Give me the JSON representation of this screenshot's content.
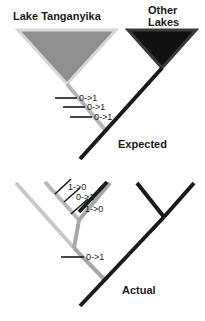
{
  "figure": {
    "width": 205,
    "height": 321,
    "background": "#ffffff",
    "colors": {
      "black": "#1a1a1a",
      "gray": "#9a9a9a",
      "light_gray": "#c9c9c9",
      "fill_gray": "#8f8f8f",
      "fill_black": "#111111",
      "outline_light": "#d0d0d0",
      "text": "#1a1a1a"
    }
  },
  "panels": [
    {
      "id": "expected",
      "label": "Expected",
      "label_pos": {
        "x": 118,
        "y": 146
      },
      "clades": [
        {
          "name": "lake-tanganyika",
          "label": "Lake Tanganyika",
          "label_lines": [
            "Lake Tanganyika"
          ],
          "label_pos": {
            "x": 13,
            "y": 16
          },
          "fill": "#8f8f8f",
          "outline": "#d0d0d0",
          "triangle": "18,30 116,30 67,84"
        },
        {
          "name": "other-lakes",
          "label": "Other Lakes",
          "label_lines": [
            "Other",
            "Lakes"
          ],
          "label_pos": {
            "x": 148,
            "y": 12
          },
          "fill": "#111111",
          "outline": "#2b2b2b",
          "triangle": "128,30 196,30 162,68"
        }
      ],
      "branches": [
        {
          "name": "tanganyika-stem",
          "color": "#b5b5b5",
          "width": 4,
          "x1": 67,
          "y1": 84,
          "x2": 106,
          "y2": 131
        },
        {
          "name": "other-lakes-stem",
          "color": "#1a1a1a",
          "width": 4,
          "x1": 162,
          "y1": 68,
          "x2": 106,
          "y2": 131
        },
        {
          "name": "root-stem",
          "color": "#1a1a1a",
          "width": 4,
          "x1": 106,
          "y1": 131,
          "x2": 80,
          "y2": 159
        }
      ],
      "changes": [
        {
          "name": "change-1",
          "text": "0->1",
          "tick": {
            "x1": 56,
            "y1": 98,
            "x2": 76,
            "y2": 98
          },
          "label_pos": {
            "x": 78,
            "y": 101
          }
        },
        {
          "name": "change-2",
          "text": "0->1",
          "tick": {
            "x1": 63,
            "y1": 107,
            "x2": 84,
            "y2": 107
          },
          "label_pos": {
            "x": 86,
            "y": 110
          }
        },
        {
          "name": "change-3",
          "text": "0->1",
          "tick": {
            "x1": 70,
            "y1": 117,
            "x2": 91,
            "y2": 117
          },
          "label_pos": {
            "x": 93,
            "y": 120
          }
        }
      ]
    },
    {
      "id": "actual",
      "label": "Actual",
      "label_pos": {
        "x": 122,
        "y": 292
      },
      "clades": [],
      "branches": [
        {
          "name": "tip-1-light",
          "color": "#c9c9c9",
          "width": 4,
          "x1": 16,
          "y1": 183,
          "x2": 73,
          "y2": 247
        },
        {
          "name": "tip-2-gray",
          "color": "#b5b5b5",
          "width": 4,
          "x1": 45,
          "y1": 182,
          "x2": 78,
          "y2": 219
        },
        {
          "name": "tip-3-gray",
          "color": "#9a9a9a",
          "width": 4,
          "x1": 109,
          "y1": 183,
          "x2": 78,
          "y2": 219
        },
        {
          "name": "internal-gray",
          "color": "#a5a5a5",
          "width": 4,
          "x1": 78,
          "y1": 219,
          "x2": 73,
          "y2": 247
        },
        {
          "name": "tip-4-black",
          "color": "#1a1a1a",
          "width": 4,
          "x1": 106,
          "y1": 182,
          "x2": 80,
          "y2": 211
        },
        {
          "name": "tip-5-black",
          "color": "#1a1a1a",
          "width": 4,
          "x1": 137,
          "y1": 183,
          "x2": 163,
          "y2": 216
        },
        {
          "name": "tip-6-black",
          "color": "#1a1a1a",
          "width": 4,
          "x1": 193,
          "y1": 183,
          "x2": 163,
          "y2": 216
        },
        {
          "name": "internal-gray-lower",
          "color": "#a5a5a5",
          "width": 4,
          "x1": 73,
          "y1": 247,
          "x2": 103,
          "y2": 278
        },
        {
          "name": "root-black-actual",
          "color": "#1a1a1a",
          "width": 4,
          "x1": 163,
          "y1": 216,
          "x2": 80,
          "y2": 305
        }
      ],
      "changes": [
        {
          "name": "change-1",
          "text": "1->0",
          "tick": {
            "x1": 56,
            "y1": 193,
            "x2": 70,
            "y2": 180
          },
          "label_pos": {
            "x": 68,
            "y": 190
          }
        },
        {
          "name": "change-2",
          "text": "0->1",
          "tick": {
            "x1": 65,
            "y1": 201,
            "x2": 79,
            "y2": 189
          },
          "label_pos": {
            "x": 76,
            "y": 200
          }
        },
        {
          "name": "change-3",
          "text": "1->0",
          "tick": {
            "x1": 72,
            "y1": 213,
            "x2": 88,
            "y2": 200
          },
          "label_pos": {
            "x": 85,
            "y": 211
          }
        },
        {
          "name": "change-4",
          "text": "0->1",
          "tick": {
            "x1": 62,
            "y1": 257,
            "x2": 84,
            "y2": 257
          },
          "label_pos": {
            "x": 86,
            "y": 260
          }
        }
      ]
    }
  ]
}
